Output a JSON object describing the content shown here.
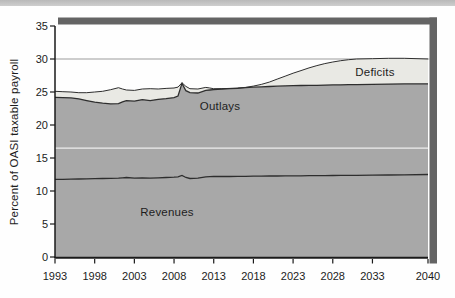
{
  "page": {
    "background": "#fefefe",
    "top_rule_color": "#c4c4c4"
  },
  "colors": {
    "area_gray": "#a8a8a8",
    "deficit_light": "#e9e9e4",
    "line_dark": "#2e2e2e",
    "axis": "#1a1a1a",
    "gridline": "#9c9c9c",
    "shadow_bar": "#646464",
    "white_scan_line": "#f6f6f6",
    "tick_text": "#1c1c1c"
  },
  "chart_data": {
    "type": "area",
    "title": "",
    "xlabel": "",
    "ylabel": "Percent of OASI taxable payroll",
    "xlim": [
      1993,
      2040
    ],
    "ylim": [
      0,
      35
    ],
    "x_ticks": [
      1993,
      1998,
      2003,
      2008,
      2013,
      2018,
      2023,
      2028,
      2033,
      2040
    ],
    "y_ticks": [
      0,
      5,
      10,
      15,
      20,
      25,
      30,
      35
    ],
    "gridlines": [
      30
    ],
    "white_reference_line_y": 16.5,
    "legend_position": "labels-inside-areas",
    "series_labels": {
      "revenues": "Revenues",
      "outlays": "Outlays",
      "deficits": "Deficits"
    },
    "x": [
      1993,
      1994,
      1995,
      1996,
      1997,
      1998,
      1999,
      2000,
      2001,
      2001.5,
      2002,
      2003,
      2004,
      2005,
      2006,
      2007,
      2008,
      2008.5,
      2009,
      2009.5,
      2010,
      2011,
      2012,
      2012.5,
      2013,
      2014,
      2015,
      2016,
      2017,
      2018,
      2019,
      2020,
      2021,
      2022,
      2023,
      2024,
      2025,
      2026,
      2027,
      2028,
      2029,
      2030,
      2031,
      2033,
      2035,
      2037,
      2040
    ],
    "series": [
      {
        "name": "Revenues",
        "values": [
          11.75,
          11.78,
          11.8,
          11.82,
          11.85,
          11.87,
          11.9,
          11.92,
          11.95,
          12.0,
          12.05,
          11.95,
          12.0,
          11.95,
          12.0,
          12.05,
          12.1,
          12.15,
          12.35,
          12.05,
          11.9,
          11.95,
          12.15,
          12.18,
          12.2,
          12.2,
          12.2,
          12.22,
          12.23,
          12.25,
          12.26,
          12.27,
          12.28,
          12.29,
          12.3,
          12.31,
          12.32,
          12.33,
          12.34,
          12.35,
          12.36,
          12.37,
          12.38,
          12.4,
          12.43,
          12.46,
          12.5
        ]
      },
      {
        "name": "Outlays",
        "values": [
          24.2,
          24.15,
          24.1,
          23.95,
          23.7,
          23.45,
          23.3,
          23.2,
          23.25,
          23.5,
          23.7,
          23.6,
          23.85,
          23.7,
          23.9,
          24.0,
          24.15,
          24.4,
          26.3,
          25.2,
          24.9,
          24.85,
          25.25,
          25.3,
          25.35,
          25.45,
          25.5,
          25.55,
          25.65,
          25.72,
          25.78,
          25.83,
          25.88,
          25.92,
          25.95,
          25.98,
          26.0,
          26.02,
          26.05,
          26.07,
          26.09,
          26.1,
          26.12,
          26.15,
          26.2,
          26.22,
          26.25
        ]
      },
      {
        "name": "Deficits top (outlays plus deficits)",
        "values": [
          25.1,
          25.05,
          25.0,
          24.9,
          24.9,
          25.0,
          25.1,
          25.35,
          25.65,
          25.45,
          25.3,
          25.25,
          25.45,
          25.5,
          25.45,
          25.55,
          25.6,
          25.75,
          26.4,
          25.85,
          25.5,
          25.45,
          25.7,
          25.6,
          25.5,
          25.5,
          25.55,
          25.6,
          25.7,
          25.9,
          26.15,
          26.5,
          26.95,
          27.4,
          27.85,
          28.25,
          28.65,
          29.0,
          29.3,
          29.55,
          29.75,
          29.9,
          30.0,
          30.05,
          30.1,
          30.1,
          30.0
        ]
      }
    ]
  }
}
